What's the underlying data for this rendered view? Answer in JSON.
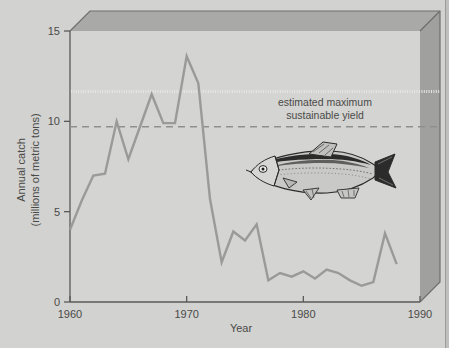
{
  "figure": {
    "kind": "3d-framed-line-chart",
    "background_color": "#d2d2d0",
    "plot_face_color": "#d4d4d2",
    "box_top_color": "#a9a9a7",
    "box_side_color": "#a0a09e",
    "box_edge_color": "#6e6e6c",
    "line_color": "#9a9a98",
    "axis_color": "#5a5a58",
    "text_color": "#4a4a48"
  },
  "annotations": [
    {
      "name": "sustainable-yield-note",
      "line1": "estimated maximum",
      "line2": "sustainable yield"
    }
  ],
  "illustration": {
    "name": "anchoveta-fish",
    "label": "anchoveta fish illustration"
  },
  "chart_data": {
    "type": "line",
    "title": "",
    "xlabel": "Year",
    "ylabel": "Annual catch\n(millions of metric tons)",
    "ylabel_line1": "Annual catch",
    "ylabel_line2": "(millions of metric tons)",
    "xlim": [
      1960,
      1990
    ],
    "ylim": [
      0,
      15
    ],
    "xticks": [
      1960,
      1970,
      1980,
      1990
    ],
    "xtick_labels": [
      "1960",
      "1970",
      "1980",
      "1990"
    ],
    "yticks": [
      0,
      5,
      10,
      15
    ],
    "ytick_labels": [
      "0",
      "5",
      "10",
      "15"
    ],
    "grid": false,
    "legend_position": "none",
    "reference_lines": [
      {
        "name": "estimated-maximum-sustainable-yield",
        "label": "estimated maximum sustainable yield",
        "y": 9.7,
        "style": "dashed",
        "color": "#8f8f8d"
      }
    ],
    "series": [
      {
        "name": "Annual catch",
        "color": "#9a9a98",
        "x": [
          1960,
          1961,
          1962,
          1963,
          1964,
          1965,
          1966,
          1967,
          1968,
          1969,
          1970,
          1971,
          1972,
          1973,
          1974,
          1975,
          1976,
          1977,
          1978,
          1979,
          1980,
          1981,
          1982,
          1983,
          1984,
          1985,
          1986,
          1987,
          1988
        ],
        "values": [
          4.0,
          5.6,
          7.0,
          7.1,
          10.0,
          7.9,
          9.7,
          11.5,
          9.9,
          9.9,
          13.6,
          12.1,
          5.7,
          2.2,
          3.9,
          3.4,
          4.3,
          1.2,
          1.6,
          1.4,
          1.7,
          1.3,
          1.8,
          1.6,
          1.2,
          0.9,
          1.1,
          3.8,
          2.1
        ]
      }
    ]
  }
}
